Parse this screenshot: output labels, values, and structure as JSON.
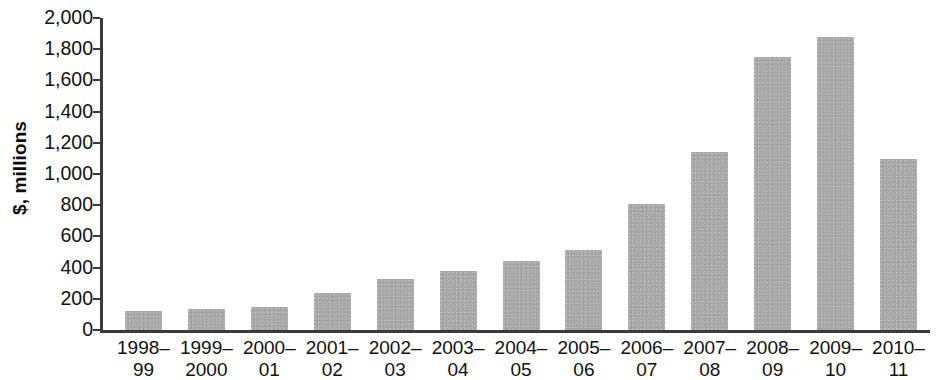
{
  "chart_data": {
    "type": "bar",
    "title": "",
    "subtitle": "",
    "xlabel": "",
    "ylabel": "$, millions",
    "ylim": [
      0,
      2000
    ],
    "ytick_step": 200,
    "grid": false,
    "legend": "none",
    "bar_color": "#a7a7a7",
    "axis_color": "#3a3a3a",
    "ytick_labels": [
      "2,000",
      "1,800",
      "1,600",
      "1,400",
      "1,200",
      "1,000",
      "800",
      "600",
      "400",
      "200",
      "0"
    ],
    "ytick_values": [
      2000,
      1800,
      1600,
      1400,
      1200,
      1000,
      800,
      600,
      400,
      200,
      0
    ],
    "categories": [
      "1998–99",
      "1999–2000",
      "2000–01",
      "2001–02",
      "2002–03",
      "2003–04",
      "2004–05",
      "2005–06",
      "2006–07",
      "2007–08",
      "2008–09",
      "2009–10",
      "2010–11"
    ],
    "category_lines": [
      [
        "1998–",
        "99"
      ],
      [
        "1999–",
        "2000"
      ],
      [
        "2000–",
        "01"
      ],
      [
        "2001–",
        "02"
      ],
      [
        "2002–",
        "03"
      ],
      [
        "2003–",
        "04"
      ],
      [
        "2004–",
        "05"
      ],
      [
        "2005–",
        "06"
      ],
      [
        "2006–",
        "07"
      ],
      [
        "2007–",
        "08"
      ],
      [
        "2008–",
        "09"
      ],
      [
        "2009–",
        "10"
      ],
      [
        "2010–",
        "11"
      ]
    ],
    "values": [
      125,
      135,
      150,
      235,
      330,
      380,
      440,
      510,
      805,
      1140,
      1750,
      1880,
      1095
    ]
  }
}
